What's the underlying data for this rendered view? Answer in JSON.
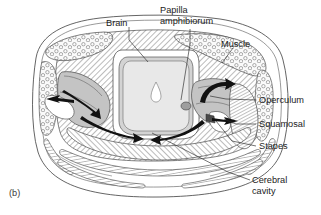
{
  "figure": {
    "panel_label": "(b)",
    "caption_note": "",
    "width": 321,
    "height": 215,
    "background_color": "#ffffff",
    "line_color": "#3d3d3d",
    "text_color": "#1b1b1b"
  },
  "labels": [
    {
      "id": "brain",
      "text": "Brain",
      "lines": [
        "Brain"
      ],
      "x": 106,
      "y": 24,
      "anchor": "start",
      "leader": "M129,27 L129,40 L148,62"
    },
    {
      "id": "papilla-amphibiorum",
      "text": "Papilla amphibiorum",
      "lines": [
        "Papilla",
        "amphibiorum"
      ],
      "x": 160,
      "y": 13,
      "anchor": "start",
      "leader": "M190,29 L190,42 L180,92"
    },
    {
      "id": "muscle",
      "text": "Muscle",
      "lines": [
        "Muscle"
      ],
      "x": 221,
      "y": 45,
      "anchor": "start",
      "leader": "M233,48 L222,62"
    },
    {
      "id": "operculum",
      "text": "Operculum",
      "lines": [
        "Operculum"
      ],
      "x": 258,
      "y": 103,
      "anchor": "start",
      "leader": "M256,100 L226,99 L208,96"
    },
    {
      "id": "squamosal",
      "text": "Squamosal",
      "lines": [
        "Squamosal"
      ],
      "x": 258,
      "y": 127,
      "anchor": "start",
      "leader": "M256,124 L236,124 L224,118"
    },
    {
      "id": "stapes",
      "text": "Stapes",
      "lines": [
        "Stapes"
      ],
      "x": 258,
      "y": 149,
      "anchor": "start",
      "leader": "M256,146 L230,140 L215,120"
    },
    {
      "id": "cerebral-cavity",
      "text": "Cerebral cavity",
      "lines": [
        "Cerebral",
        "cavity"
      ],
      "x": 252,
      "y": 183,
      "anchor": "start",
      "leader": "M250,180 L228,172 L152,133"
    }
  ],
  "structures": [
    {
      "id": "head-outline",
      "name": "head-cross-section-outline",
      "fill": "#ffffff"
    },
    {
      "id": "brain-body",
      "name": "brain",
      "fill": "#e2e2e2"
    },
    {
      "id": "brain-ventricle",
      "name": "brain-ventricle",
      "fill": "#ffffff"
    },
    {
      "id": "left-otic-capsule",
      "name": "left-otic-capsule",
      "fill": "#c9c9c9"
    },
    {
      "id": "right-otic-capsule",
      "name": "right-otic-capsule",
      "fill": "#c9c9c9"
    },
    {
      "id": "muscle-left",
      "name": "left-muscle-mass",
      "fill": "#f2f2f2"
    },
    {
      "id": "muscle-right",
      "name": "right-muscle-mass",
      "fill": "#f2f2f2"
    },
    {
      "id": "cranial-hatch",
      "name": "cranial-bone-hatching",
      "fill": "#ffffff"
    },
    {
      "id": "lower-jaw-elements",
      "name": "lower-jaw-bone-elements",
      "fill": "#ffffff"
    }
  ],
  "arrows": [
    {
      "id": "arrow-left-lateral",
      "name": "sound-path-left-lateral"
    },
    {
      "id": "arrow-left-inward",
      "name": "sound-path-left-inward"
    },
    {
      "id": "arrow-left-ventral",
      "name": "sound-path-left-ventral"
    },
    {
      "id": "arrow-right-curve",
      "name": "sound-path-right-curve"
    },
    {
      "id": "arrow-right-lateral",
      "name": "sound-path-right-lateral"
    },
    {
      "id": "arrow-right-ventral",
      "name": "sound-path-right-ventral"
    }
  ]
}
